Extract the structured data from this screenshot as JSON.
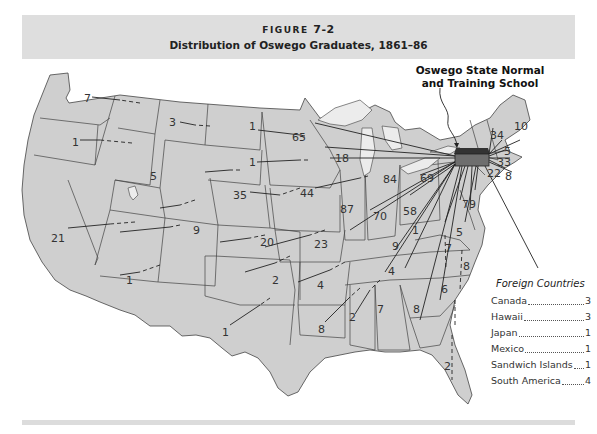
{
  "figure": {
    "label": "FIGURE",
    "number": "7-2",
    "title": "Distribution of Oswego Graduates, 1861–86"
  },
  "school": {
    "label_line1": "Oswego State Normal",
    "label_line2": "and Training School"
  },
  "states": [
    {
      "name": "Washington",
      "count": "7"
    },
    {
      "name": "Oregon",
      "count": "1"
    },
    {
      "name": "Montana",
      "count": "3"
    },
    {
      "name": "Wyoming",
      "count": "5"
    },
    {
      "name": "California",
      "count": "21"
    },
    {
      "name": "Colorado",
      "count": "9"
    },
    {
      "name": "Arizona",
      "count": "1"
    },
    {
      "name": "North Dakota",
      "count": "1"
    },
    {
      "name": "South Dakota",
      "count": "1"
    },
    {
      "name": "Nebraska",
      "count": "35"
    },
    {
      "name": "Kansas",
      "count": "20"
    },
    {
      "name": "Oklahoma",
      "count": "2"
    },
    {
      "name": "Texas",
      "count": "1"
    },
    {
      "name": "Minnesota",
      "count": "65"
    },
    {
      "name": "Wisconsin",
      "count": "18"
    },
    {
      "name": "Iowa",
      "count": "44"
    },
    {
      "name": "Missouri",
      "count": "23"
    },
    {
      "name": "Arkansas",
      "count": "4"
    },
    {
      "name": "Louisiana",
      "count": "8"
    },
    {
      "name": "Michigan",
      "count": "84"
    },
    {
      "name": "Illinois",
      "count": "87"
    },
    {
      "name": "Indiana",
      "count": "70"
    },
    {
      "name": "Ohio",
      "count": "58"
    },
    {
      "name": "Kentucky",
      "count": "9"
    },
    {
      "name": "Tennessee",
      "count": "4"
    },
    {
      "name": "Mississippi",
      "count": "2"
    },
    {
      "name": "Alabama",
      "count": "7"
    },
    {
      "name": "Georgia",
      "count": "8"
    },
    {
      "name": "Florida",
      "count": "2"
    },
    {
      "name": "South Carolina",
      "count": "6"
    },
    {
      "name": "North Carolina",
      "count": "8"
    },
    {
      "name": "Virginia",
      "count": "7"
    },
    {
      "name": "West Virginia",
      "count": "1"
    },
    {
      "name": "Maryland",
      "count": "5"
    },
    {
      "name": "Pennsylvania",
      "count": "69"
    },
    {
      "name": "New Jersey",
      "count": "79"
    },
    {
      "name": "Vermont",
      "count": "34"
    },
    {
      "name": "Maine",
      "count": "10"
    },
    {
      "name": "New Hampshire",
      "count": "5"
    },
    {
      "name": "Massachusetts",
      "count": "33"
    },
    {
      "name": "Connecticut",
      "count": "22"
    },
    {
      "name": "Rhode Island",
      "count": "8"
    }
  ],
  "legend": {
    "title": "Foreign Countries",
    "items": [
      {
        "name": "Canada",
        "value": "3"
      },
      {
        "name": "Hawaii",
        "value": "3"
      },
      {
        "name": "Japan",
        "value": "1"
      },
      {
        "name": "Mexico",
        "value": "1"
      },
      {
        "name": "Sandwich Islands",
        "value": "1"
      },
      {
        "name": "South America",
        "value": "4"
      }
    ]
  },
  "colors": {
    "land": "#cfcfcf",
    "header_band": "#dedede",
    "school_marker": "#6e6e6e"
  }
}
